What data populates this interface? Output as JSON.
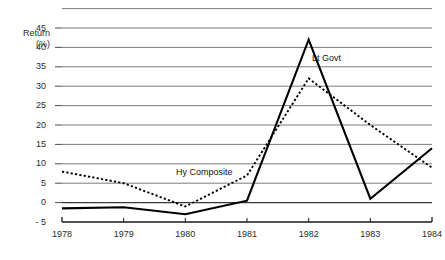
{
  "axis_title": {
    "line1": "Return",
    "line2": "(%)"
  },
  "series_labels": {
    "lt_govt": "Lt Govt",
    "hy_composite": "Hy Composite"
  },
  "chart_data": {
    "type": "line",
    "title": "",
    "subtitle": "",
    "xlabel": "",
    "ylabel": "Return (%)",
    "x": [
      1978,
      1979,
      1980,
      1981,
      1982,
      1983,
      1984
    ],
    "categories": [
      "1978",
      "1979",
      "1980",
      "1981",
      "1982",
      "1983",
      "1984"
    ],
    "xlim": [
      1978,
      1984
    ],
    "ylim": [
      -5,
      50
    ],
    "y_ticks": [
      45,
      40,
      35,
      30,
      25,
      20,
      15,
      10,
      5,
      0,
      -5
    ],
    "y_tick_labels": [
      "45",
      "40",
      "35",
      "30",
      "25",
      "20",
      "15",
      "10",
      "5",
      "0",
      "- 5"
    ],
    "x_ticks": [
      1978,
      1979,
      1980,
      1981,
      1982,
      1983,
      1984
    ],
    "x_tick_labels": [
      "1978",
      "1979",
      "1980",
      "1981",
      "1982",
      "1983",
      "1984"
    ],
    "grid": true,
    "grid_axis": "y",
    "legend": "inline-annotations",
    "series": [
      {
        "name": "Lt Govt",
        "style": "solid",
        "color": "#000000",
        "values": [
          -1.5,
          -1.2,
          -3.0,
          0.5,
          42.0,
          1.0,
          14.0
        ]
      },
      {
        "name": "Hy Composite",
        "style": "dotted",
        "color": "#000000",
        "values": [
          8.0,
          5.0,
          -1.0,
          7.0,
          32.0,
          20.0,
          9.0
        ]
      }
    ],
    "annotations": [
      {
        "text": "Lt Govt",
        "x": 1982.35,
        "y": 37.0
      },
      {
        "text": "Hy Composite",
        "x": 1980.7,
        "y": 8.0
      }
    ]
  }
}
